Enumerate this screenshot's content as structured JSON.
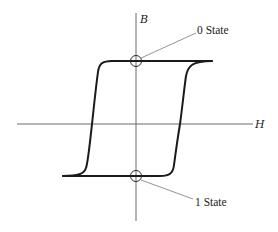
{
  "diagram": {
    "title": "",
    "type": "magnetic hysteresis loop",
    "axes": {
      "x_label": "H",
      "y_label": "B"
    },
    "annotations": [
      {
        "id": "zero-state",
        "label": "0 State",
        "position": "positive remanence (B axis, upper)"
      },
      {
        "id": "one-state",
        "label": "1 State",
        "position": "negative remanence (B axis, lower)"
      }
    ],
    "colors": {
      "curve": "#1a1a1a",
      "axes": "#6a6a6a",
      "leaders": "#7a7a7a",
      "background": "#ffffff"
    }
  }
}
